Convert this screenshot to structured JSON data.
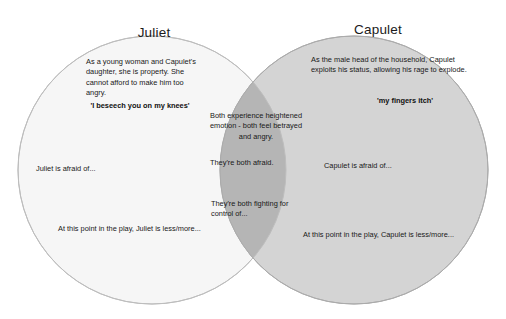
{
  "diagram": {
    "type": "venn",
    "background_color": "#ffffff",
    "left": {
      "title": "Juliet",
      "fill_color": "#f6f6f6",
      "stroke_color": "#b9b9b9",
      "description": "As a young woman and Capulet's daughter, she is property. She cannot afford to make him too angry.",
      "quote": "'I beseech you on my knees'",
      "afraid_prompt": "Juliet is afraid of...",
      "point_in_play_prompt": "At this point in the play, Juliet is less/more..."
    },
    "right": {
      "title": "Capulet",
      "fill_color": "#d4d4d4",
      "stroke_color": "#a8a8a8",
      "description": "As the male head of the household, Capulet exploits his status, allowing his rage to explode.",
      "quote": "'my fingers itch'",
      "afraid_prompt": "Capulet is afraid of...",
      "point_in_play_prompt": "At this point in the play, Capulet is less/more..."
    },
    "overlap": {
      "fill_color": "#b5b5b5",
      "shared_emotion": "Both experience heightened emotion - both feel betrayed and angry.",
      "shared_afraid": "They're both afraid.",
      "shared_control": "They're both fighting for control of..."
    }
  }
}
